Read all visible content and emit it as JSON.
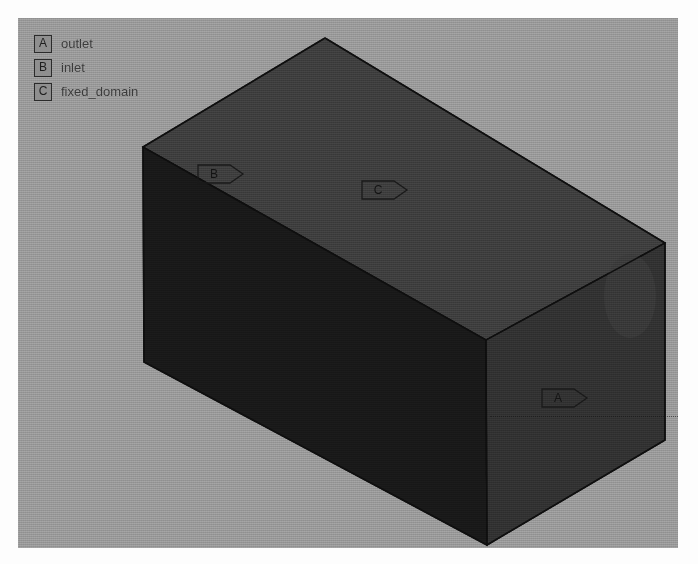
{
  "app": {
    "title": "Boundary Condition Viewport",
    "background_color": "#9b9b9b",
    "page_background_color": "#fdfdfd"
  },
  "viewport": {
    "name": "3d-model-viewport",
    "width": 660,
    "height": 530,
    "background_color": "#9b9b9b"
  },
  "legend": {
    "name": "boundary-legend",
    "items": [
      {
        "key": "A",
        "label": "outlet"
      },
      {
        "key": "B",
        "label": "inlet"
      },
      {
        "key": "C",
        "label": "fixed_domain"
      }
    ],
    "swatch_border_color": "#2b2b2b",
    "swatch_fill_color": "#8f8f8f",
    "text_color": "#3a3a3a"
  },
  "model": {
    "name": "rectangular-duct-solid",
    "shape": "box",
    "projection": "isometric",
    "faces": [
      {
        "id": "top",
        "label_key": "C",
        "fill": "#3f3f3f"
      },
      {
        "id": "front_left",
        "label_key": "B",
        "fill": "#191919"
      },
      {
        "id": "front_right",
        "label_key": "A",
        "fill": "#323232"
      }
    ],
    "edge_color": "#0f0f0f",
    "vertices": {
      "top_apex": [
        325,
        38
      ],
      "left_upper": [
        143,
        147
      ],
      "right_upper": [
        665,
        243
      ],
      "front_center_up": [
        486,
        340
      ],
      "left_lower": [
        144,
        362
      ],
      "bottom_apex": [
        487,
        545
      ],
      "right_lower": [
        665,
        440
      ]
    }
  },
  "tags": [
    {
      "key": "A",
      "name": "face-tag-a",
      "text": "A",
      "points_to": "outlet-face",
      "has_leader_line": true
    },
    {
      "key": "B",
      "name": "face-tag-b",
      "text": "B",
      "points_to": "inlet-face",
      "has_leader_line": false
    },
    {
      "key": "C",
      "name": "face-tag-c",
      "text": "C",
      "points_to": "fixed-domain-face",
      "has_leader_line": false
    }
  ],
  "colors": {
    "face_top": "#3f3f3f",
    "face_front_left": "#191919",
    "face_front_right": "#323232",
    "edge": "#0f0f0f",
    "tag_stroke": "#1a1a1a",
    "tag_text": "#141414"
  }
}
